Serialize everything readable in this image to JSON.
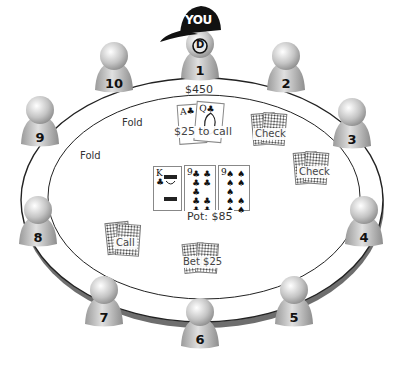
{
  "hero": {
    "cap_text": "YOU",
    "dealer_button": "D",
    "seat": 1,
    "stack": "$450",
    "hole_cards": [
      "A♣",
      "Q♣"
    ],
    "action": "$25 to call"
  },
  "seats": [
    {
      "number": "1",
      "action": ""
    },
    {
      "number": "2",
      "action": "Check"
    },
    {
      "number": "3",
      "action": "Check"
    },
    {
      "number": "4",
      "action": ""
    },
    {
      "number": "5",
      "action": ""
    },
    {
      "number": "6",
      "action": "Bet $25"
    },
    {
      "number": "7",
      "action": ""
    },
    {
      "number": "8",
      "action": "Call"
    },
    {
      "number": "9",
      "action": "Fold"
    },
    {
      "number": "10",
      "action": "Fold"
    }
  ],
  "board": {
    "cards": [
      {
        "rank": "K",
        "suit": "♣"
      },
      {
        "rank": "9",
        "suit": "♣"
      },
      {
        "rank": "9",
        "suit": "♠"
      }
    ],
    "pot": "Pot: $85"
  },
  "colors": {
    "table_line": "#222222",
    "rim_shadow": "#6e6e6e",
    "seat_light": "#e8e8e8",
    "seat_dark": "#8a8a8a",
    "cap": "#111111"
  }
}
